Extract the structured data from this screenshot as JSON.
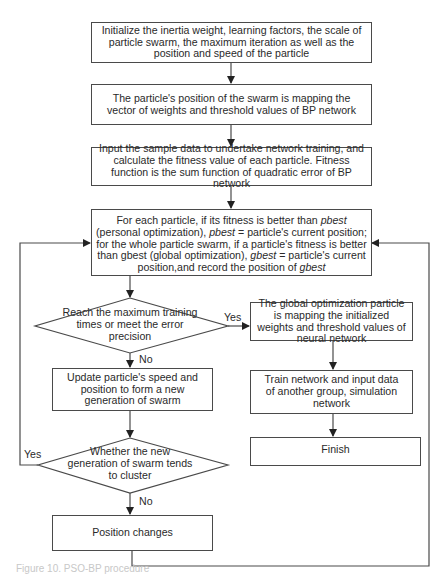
{
  "diagram": {
    "type": "flowchart",
    "nodes": {
      "init": "Initialize the inertia weight, learning factors, the scale of particle swarm, the maximum iteration as well as the position and speed of the particle",
      "mapping": "The particle's position of the swarm is mapping the vector of weights and threshold values of BP network",
      "fitness": "Input the sample data to undertake network training, and calculate the fitness value of each particle. Fitness function is the sum function of quadratic error of BP network",
      "update_best": {
        "part1": "For each particle, if its fitness is better than ",
        "pbest1": "pbest",
        "part2": " (personal optimization), ",
        "pbest2": "pbest",
        "part3": " = particle's current position; for the whole particle swarm, if a particle's fitness is better than gbest (global optimization), ",
        "gbest1": "gbest",
        "part4": " = particle's current position,and record the position of ",
        "gbest2": "gbest"
      },
      "decision_max": "Reach the maximum training times or meet the error precision",
      "global_map": "The global optimization particle is mapping the initialized weights and threshold values of neural network",
      "update_speed": "Update particle's speed and position to form a new generation of swarm",
      "train": "Train network and input data of another group, simulation network",
      "finish": "Finish",
      "decision_cluster": "Whether the new generation of swarm tends to cluster",
      "position_changes": "Position changes"
    },
    "edge_labels": {
      "max_yes": "Yes",
      "max_no": "No",
      "cluster_yes": "Yes",
      "cluster_no": "No"
    },
    "caption": "Figure 10. PSO-BP procedure"
  }
}
